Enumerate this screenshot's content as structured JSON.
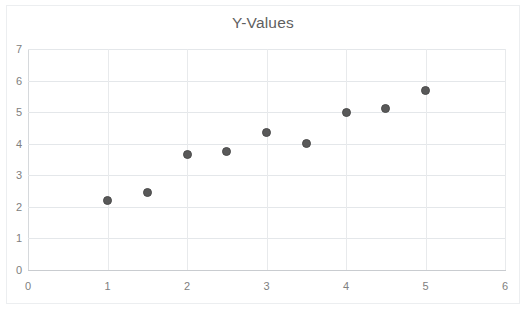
{
  "chart_data": {
    "type": "scatter",
    "title": "Y-Values",
    "xlabel": "",
    "ylabel": "",
    "xlim": [
      0,
      6
    ],
    "ylim": [
      0,
      7
    ],
    "x_ticks": [
      "0",
      "1",
      "2",
      "3",
      "4",
      "5",
      "6"
    ],
    "y_ticks": [
      "0",
      "1",
      "2",
      "3",
      "4",
      "5",
      "6",
      "7"
    ],
    "grid": "horizontal-and-vertical",
    "legend": "none",
    "series": [
      {
        "name": "Y-Values",
        "marker_color": "#595959",
        "points": [
          {
            "x": 1,
            "y": 2.2
          },
          {
            "x": 1.5,
            "y": 2.47
          },
          {
            "x": 2,
            "y": 3.65
          },
          {
            "x": 2.5,
            "y": 3.75
          },
          {
            "x": 3,
            "y": 4.35
          },
          {
            "x": 3.5,
            "y": 4.02
          },
          {
            "x": 4,
            "y": 5.0
          },
          {
            "x": 4.5,
            "y": 5.1
          },
          {
            "x": 5,
            "y": 5.7
          }
        ]
      }
    ]
  },
  "colors": {
    "marker": "#595959",
    "gridline": "#e4e7ea",
    "axis": "#c9ccd0",
    "tick_text": "#808080",
    "title_text": "#5f5f5f",
    "background": "#ffffff"
  }
}
